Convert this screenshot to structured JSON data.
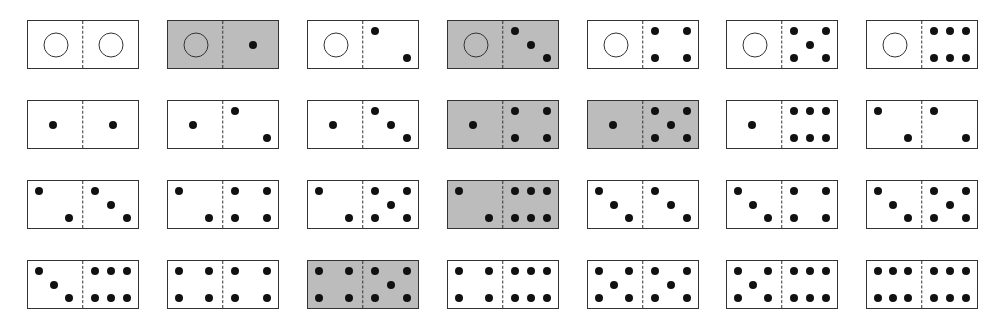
{
  "colors": {
    "tile": "#ffffff",
    "shaded_tile": "#bcbcbc",
    "pip": "#111111",
    "border": "#333333"
  },
  "layout": {
    "columns_x": [
      27,
      167,
      307,
      447,
      587,
      726,
      866
    ],
    "rows_y": [
      20,
      100,
      180,
      260
    ]
  },
  "rows": [
    {
      "dominoes": [
        {
          "left": 0,
          "right": 0,
          "shaded": false,
          "label": "0|0"
        },
        {
          "left": 0,
          "right": 1,
          "shaded": true,
          "label": "0|1"
        },
        {
          "left": 0,
          "right": 2,
          "shaded": false,
          "label": "0|2"
        },
        {
          "left": 0,
          "right": 3,
          "shaded": true,
          "label": "0|3"
        },
        {
          "left": 0,
          "right": 4,
          "shaded": false,
          "label": "0|4"
        },
        {
          "left": 0,
          "right": 5,
          "shaded": false,
          "label": "0|5"
        },
        {
          "left": 0,
          "right": 6,
          "shaded": false,
          "label": "0|6"
        }
      ]
    },
    {
      "dominoes": [
        {
          "left": 1,
          "right": 1,
          "shaded": false,
          "label": "1|1"
        },
        {
          "left": 1,
          "right": 2,
          "shaded": false,
          "label": "1|2"
        },
        {
          "left": 1,
          "right": 3,
          "shaded": false,
          "label": "1|3"
        },
        {
          "left": 1,
          "right": 4,
          "shaded": true,
          "label": "1|4"
        },
        {
          "left": 1,
          "right": 5,
          "shaded": true,
          "label": "1|5"
        },
        {
          "left": 1,
          "right": 6,
          "shaded": false,
          "label": "1|6"
        },
        {
          "left": 2,
          "right": 2,
          "shaded": false,
          "label": "2|2"
        }
      ]
    },
    {
      "dominoes": [
        {
          "left": 2,
          "right": 3,
          "shaded": false,
          "label": "2|3"
        },
        {
          "left": 2,
          "right": 4,
          "shaded": false,
          "label": "2|4"
        },
        {
          "left": 2,
          "right": 5,
          "shaded": false,
          "label": "2|5"
        },
        {
          "left": 2,
          "right": 6,
          "shaded": true,
          "label": "2|6"
        },
        {
          "left": 3,
          "right": 3,
          "shaded": false,
          "label": "3|3"
        },
        {
          "left": 3,
          "right": 4,
          "shaded": false,
          "label": "3|4"
        },
        {
          "left": 3,
          "right": 5,
          "shaded": false,
          "label": "3|5"
        }
      ]
    },
    {
      "dominoes": [
        {
          "left": 3,
          "right": 6,
          "shaded": false,
          "label": "3|6"
        },
        {
          "left": 4,
          "right": 4,
          "shaded": false,
          "label": "4|4"
        },
        {
          "left": 4,
          "right": 5,
          "shaded": true,
          "label": "4|5"
        },
        {
          "left": 4,
          "right": 6,
          "shaded": false,
          "label": "4|6"
        },
        {
          "left": 5,
          "right": 5,
          "shaded": false,
          "label": "5|5"
        },
        {
          "left": 5,
          "right": 6,
          "shaded": false,
          "label": "5|6"
        },
        {
          "left": 6,
          "right": 6,
          "shaded": false,
          "label": "6|6"
        }
      ]
    }
  ]
}
